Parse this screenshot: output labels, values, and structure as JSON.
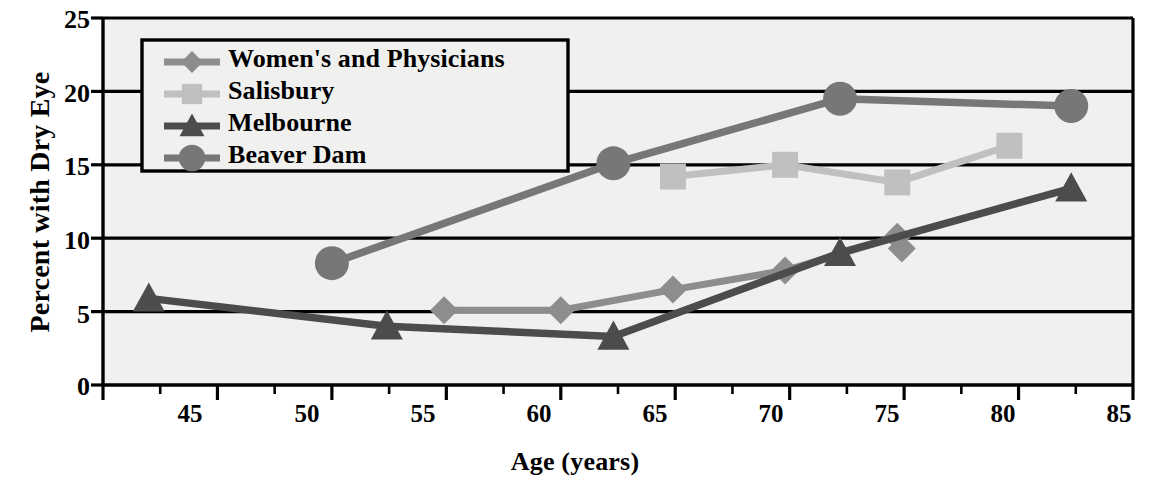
{
  "chart_data": {
    "type": "line",
    "title": "",
    "xlabel": "Age (years)",
    "ylabel": "Percent with Dry Eye",
    "xlim": [
      42.5,
      87.5
    ],
    "ylim": [
      0,
      25
    ],
    "xticks": [
      45,
      50,
      55,
      60,
      65,
      70,
      75,
      80,
      85
    ],
    "yticks": [
      0,
      5,
      10,
      15,
      20,
      25
    ],
    "grid": "horizontal",
    "legend_position": "top-left",
    "series": [
      {
        "name": "Women's and Physicians",
        "marker": "diamond",
        "color": "#8d8d8d",
        "points": [
          {
            "x": 57.4,
            "y": 5.1
          },
          {
            "x": 62.5,
            "y": 5.1
          },
          {
            "x": 67.4,
            "y": 6.5
          },
          {
            "x": 72.3,
            "y": 7.8
          },
          {
            "x": 77.2,
            "y": 10.1
          },
          {
            "x": 77.4,
            "y": 9.3
          }
        ]
      },
      {
        "name": "Salisbury",
        "marker": "square",
        "color": "#c0c0c0",
        "points": [
          {
            "x": 67.4,
            "y": 14.2
          },
          {
            "x": 72.3,
            "y": 15.0
          },
          {
            "x": 77.2,
            "y": 13.8
          },
          {
            "x": 82.1,
            "y": 16.3
          }
        ]
      },
      {
        "name": "Melbourne",
        "marker": "triangle",
        "color": "#4c4c4c",
        "points": [
          {
            "x": 44.5,
            "y": 5.9
          },
          {
            "x": 54.9,
            "y": 4.0
          },
          {
            "x": 64.8,
            "y": 3.3
          },
          {
            "x": 74.7,
            "y": 9.0
          },
          {
            "x": 84.8,
            "y": 13.4
          }
        ]
      },
      {
        "name": "Beaver Dam",
        "marker": "circle",
        "color": "#777777",
        "points": [
          {
            "x": 52.5,
            "y": 8.3
          },
          {
            "x": 64.8,
            "y": 15.1
          },
          {
            "x": 74.7,
            "y": 19.5
          },
          {
            "x": 84.8,
            "y": 19.0
          }
        ]
      }
    ]
  },
  "axes": {
    "ylabel": "Percent with Dry Eye",
    "xlabel": "Age (years)",
    "ytick_labels": [
      "25",
      "20",
      "15",
      "10",
      "5",
      "0"
    ],
    "xtick_labels": [
      "45",
      "50",
      "55",
      "60",
      "65",
      "70",
      "75",
      "80",
      "85"
    ]
  },
  "legend": {
    "items": [
      {
        "label": "Women's and Physicians"
      },
      {
        "label": "Salisbury"
      },
      {
        "label": "Melbourne"
      },
      {
        "label": "Beaver Dam"
      }
    ]
  },
  "colors": {
    "plot_background": "#f0f0ee",
    "axis": "#000000",
    "gridline": "#000000",
    "womens": "#8d8d8d",
    "salisbury": "#c0c0c0",
    "melbourne": "#4c4c4c",
    "beaverdam": "#777777"
  }
}
